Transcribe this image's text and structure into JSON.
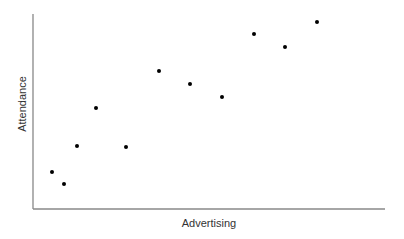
{
  "chart_data": {
    "type": "scatter",
    "title": "",
    "xlabel": "Advertising",
    "ylabel": "Attendance",
    "grid": false,
    "legend": null,
    "ticks": {
      "x": [],
      "y": []
    },
    "units": "pixel coordinates read from the screenshot; axes have no tick labels",
    "xlim": [
      33,
      385
    ],
    "ylim": [
      209,
      14
    ],
    "points": [
      {
        "x": 52,
        "y": 172
      },
      {
        "x": 64,
        "y": 184
      },
      {
        "x": 77,
        "y": 146
      },
      {
        "x": 96,
        "y": 108
      },
      {
        "x": 126,
        "y": 147
      },
      {
        "x": 159,
        "y": 71
      },
      {
        "x": 190,
        "y": 84
      },
      {
        "x": 222,
        "y": 97
      },
      {
        "x": 254,
        "y": 34
      },
      {
        "x": 285,
        "y": 47
      },
      {
        "x": 317,
        "y": 22
      }
    ]
  },
  "colors": {
    "axis": "#888888",
    "point": "#000000",
    "label": "#333333"
  }
}
